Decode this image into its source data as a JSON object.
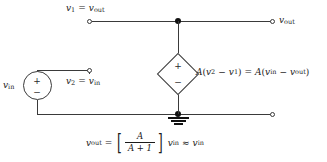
{
  "figure": {
    "type": "circuit-diagram"
  },
  "labels": {
    "top_left_node": {
      "var": "v",
      "sub": "1",
      "rel": "=",
      "var2": "v",
      "sub2": "out"
    },
    "top_right_terminal": {
      "var": "v",
      "sub": "out"
    },
    "input_node": {
      "var": "v",
      "sub": "2",
      "rel": "=",
      "var2": "v",
      "sub2": "in"
    },
    "source_label": {
      "var": "v",
      "sub": "in"
    }
  },
  "source": {
    "plus": "+",
    "minus": "−"
  },
  "dependent_source": {
    "plus": "+",
    "minus": "−",
    "expression": {
      "gain": "A",
      "open_paren": "(",
      "term1_var": "v",
      "term1_sub": "2",
      "minus": "−",
      "term2_var": "v",
      "term2_sub": "1",
      "close_paren": ")",
      "equals": "=",
      "gain2": "A",
      "open_paren2": "(",
      "term3_var": "v",
      "term3_sub": "in",
      "minus2": "−",
      "term4_var": "v",
      "term4_sub": "out",
      "close_paren2": ")"
    }
  },
  "result_equation": {
    "lhs_var": "v",
    "lhs_sub": "out",
    "equals": "=",
    "bracket_open": "[",
    "numerator": "A",
    "denominator": "A + 1",
    "bracket_close": "]",
    "rhs_var": "v",
    "rhs_sub": "in",
    "approx": "≈",
    "approx_var": "v",
    "approx_sub": "in"
  },
  "ground": {
    "name": "ground-symbol"
  },
  "colors": {
    "wire": "#3a3a3a",
    "node": "#111111",
    "text": "#1a1a1a",
    "background": "#ffffff"
  }
}
